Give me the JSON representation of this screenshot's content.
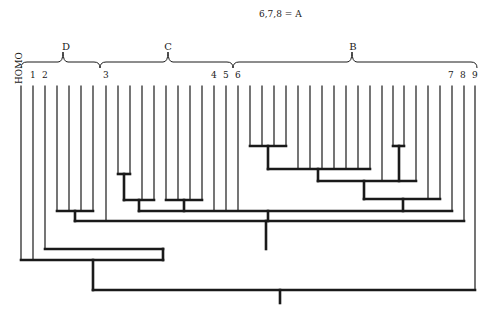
{
  "legend": {
    "equation": "6,7,8 = A"
  },
  "groups": [
    {
      "name": "D",
      "x1": 21,
      "x2": 100,
      "peak": 63
    },
    {
      "name": "C",
      "x1": 100,
      "x2": 233,
      "peak": 168
    },
    {
      "name": "B",
      "x1": 233,
      "x2": 477,
      "peak": 352
    }
  ],
  "outgroup_label": "HOMO",
  "leaf_labels": [
    {
      "text": "1",
      "x": 30
    },
    {
      "text": "2",
      "x": 42
    },
    {
      "text": "3",
      "x": 103
    },
    {
      "text": "4",
      "x": 211
    },
    {
      "text": "5",
      "x": 223
    },
    {
      "text": "6",
      "x": 235
    },
    {
      "text": "7",
      "x": 448
    },
    {
      "text": "8",
      "x": 460
    },
    {
      "text": "9",
      "x": 472
    }
  ],
  "colors": {
    "line": "#1a1a1a",
    "background": "#ffffff"
  },
  "tree": {
    "leaf_top": 86,
    "leaves_x": [
      21,
      33,
      45,
      57,
      69,
      81,
      93,
      106,
      118,
      130,
      142,
      154,
      166,
      178,
      190,
      202,
      214,
      226,
      238,
      250,
      262,
      274,
      286,
      298,
      310,
      322,
      334,
      346,
      358,
      370,
      382,
      394,
      404,
      416,
      428,
      440,
      452,
      464,
      475
    ],
    "thin_lines": [
      [
        21,
        86,
        21,
        260
      ],
      [
        33,
        86,
        33,
        260
      ],
      [
        45,
        86,
        45,
        249
      ],
      [
        57,
        86,
        57,
        211
      ],
      [
        69,
        86,
        69,
        211
      ],
      [
        81,
        86,
        81,
        211
      ],
      [
        93,
        86,
        93,
        211
      ],
      [
        106,
        86,
        106,
        221
      ],
      [
        118,
        86,
        118,
        174
      ],
      [
        130,
        86,
        130,
        174
      ],
      [
        142,
        86,
        142,
        200
      ],
      [
        154,
        86,
        154,
        200
      ],
      [
        166,
        86,
        166,
        200
      ],
      [
        178,
        86,
        178,
        200
      ],
      [
        190,
        86,
        190,
        200
      ],
      [
        202,
        86,
        202,
        200
      ],
      [
        214,
        86,
        214,
        211
      ],
      [
        226,
        86,
        226,
        211
      ],
      [
        238,
        86,
        238,
        211
      ],
      [
        250,
        86,
        250,
        146
      ],
      [
        262,
        86,
        262,
        146
      ],
      [
        274,
        86,
        274,
        146
      ],
      [
        286,
        86,
        286,
        146
      ],
      [
        298,
        86,
        298,
        169
      ],
      [
        310,
        86,
        310,
        169
      ],
      [
        322,
        86,
        322,
        169
      ],
      [
        334,
        86,
        334,
        169
      ],
      [
        346,
        86,
        346,
        169
      ],
      [
        358,
        86,
        358,
        169
      ],
      [
        370,
        86,
        370,
        169
      ],
      [
        382,
        86,
        382,
        181
      ],
      [
        393,
        86,
        393,
        146
      ],
      [
        404,
        86,
        404,
        146
      ],
      [
        416,
        86,
        416,
        181
      ],
      [
        428,
        86,
        428,
        199
      ],
      [
        440,
        86,
        440,
        199
      ],
      [
        452,
        86,
        452,
        211
      ],
      [
        464,
        86,
        464,
        221
      ],
      [
        475,
        86,
        475,
        290
      ]
    ],
    "thick_lines": [
      [
        118,
        174,
        130,
        174
      ],
      [
        124,
        174,
        124,
        200
      ],
      [
        124,
        200,
        154,
        200
      ],
      [
        166,
        200,
        202,
        200
      ],
      [
        184,
        200,
        184,
        211
      ],
      [
        139,
        200,
        139,
        211
      ],
      [
        57,
        211,
        93,
        211
      ],
      [
        75,
        211,
        75,
        221
      ],
      [
        250,
        146,
        286,
        146
      ],
      [
        268,
        146,
        268,
        169
      ],
      [
        268,
        169,
        370,
        169
      ],
      [
        318,
        169,
        318,
        181
      ],
      [
        393,
        146,
        404,
        146
      ],
      [
        399,
        146,
        399,
        181
      ],
      [
        318,
        181,
        416,
        181
      ],
      [
        364,
        181,
        364,
        199
      ],
      [
        364,
        199,
        440,
        199
      ],
      [
        403,
        199,
        403,
        211
      ],
      [
        139,
        211,
        452,
        211
      ],
      [
        268,
        211,
        268,
        221
      ],
      [
        75,
        221,
        464,
        221
      ],
      [
        266,
        221,
        266,
        249
      ],
      [
        45,
        249,
        163,
        249
      ],
      [
        163,
        249,
        163,
        260
      ],
      [
        21,
        260,
        163,
        260
      ],
      [
        93,
        260,
        93,
        290
      ],
      [
        93,
        290,
        475,
        290
      ],
      [
        280,
        290,
        280,
        303
      ]
    ]
  }
}
